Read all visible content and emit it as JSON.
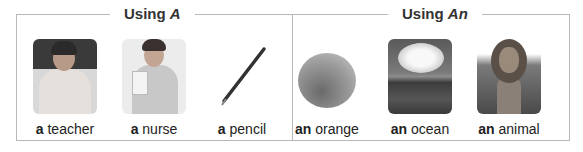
{
  "sections": [
    {
      "title_prefix": "Using ",
      "title_article": "A",
      "items": [
        {
          "article": "a",
          "noun": "teacher",
          "image": "teacher-photo"
        },
        {
          "article": "a",
          "noun": "nurse",
          "image": "nurse-photo"
        },
        {
          "article": "a",
          "noun": "pencil",
          "image": "pencil-photo"
        }
      ]
    },
    {
      "title_prefix": "Using ",
      "title_article": "An",
      "items": [
        {
          "article": "an",
          "noun": "orange",
          "image": "orange-photo"
        },
        {
          "article": "an",
          "noun": "ocean",
          "image": "ocean-photo"
        },
        {
          "article": "an",
          "noun": "animal",
          "image": "lion-photo"
        }
      ]
    }
  ]
}
